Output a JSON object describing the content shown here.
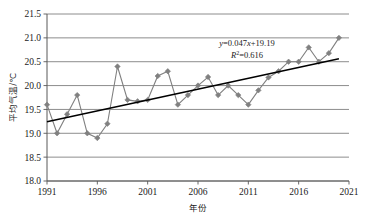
{
  "chart_data": {
    "type": "line",
    "title": "",
    "subtitle": "",
    "xlabel": "年份",
    "ylabel": "平均气温/℃",
    "xlim": [
      1991,
      2021
    ],
    "ylim": [
      18.0,
      21.5
    ],
    "xticks": [
      "1991",
      "1996",
      "2001",
      "2006",
      "2011",
      "2016",
      "2021"
    ],
    "xtick_values": [
      1991,
      1996,
      2001,
      2006,
      2011,
      2016,
      2021
    ],
    "yticks": [
      "18.0",
      "18.5",
      "19.0",
      "19.5",
      "20.0",
      "20.5",
      "21.0",
      "21.5"
    ],
    "ytick_values": [
      18.0,
      18.5,
      19.0,
      19.5,
      20.0,
      20.5,
      21.0,
      21.5
    ],
    "grid": "horizontal",
    "legend": "none",
    "marker": "diamond",
    "series": [
      {
        "name": "平均气温",
        "color": "#808080",
        "x": [
          1991,
          1992,
          1993,
          1994,
          1995,
          1996,
          1997,
          1998,
          1999,
          2000,
          2001,
          2002,
          2003,
          2004,
          2005,
          2006,
          2007,
          2008,
          2009,
          2010,
          2011,
          2012,
          2013,
          2014,
          2015,
          2016,
          2017,
          2018,
          2019,
          2020
        ],
        "values": [
          19.6,
          19.0,
          19.4,
          19.8,
          19.0,
          18.9,
          19.2,
          20.4,
          19.7,
          19.67,
          19.7,
          20.2,
          20.3,
          19.6,
          19.8,
          20.0,
          20.18,
          19.8,
          20.0,
          19.8,
          19.6,
          19.9,
          20.17,
          20.3,
          20.5,
          20.5,
          20.8,
          20.5,
          20.68,
          21.0
        ]
      }
    ],
    "trendline": {
      "name": "线性趋势线",
      "color": "#000000",
      "equation": "y=0.047x+19.19",
      "equation_y_label": "y",
      "equation_body": "=0.047",
      "equation_x_label": "x",
      "equation_tail": "+19.19",
      "r_squared_label": "R",
      "r_squared_sup": "2",
      "r_squared_value": "=0.616",
      "slope": 0.047,
      "intercept": 19.19,
      "r2": 0.616,
      "start": {
        "x": 1991,
        "y": 19.24
      },
      "end": {
        "x": 2020,
        "y": 20.56
      }
    }
  },
  "annotations": {
    "equation_line1": "y=0.047x+19.19",
    "equation_line2": "R²=0.616"
  }
}
